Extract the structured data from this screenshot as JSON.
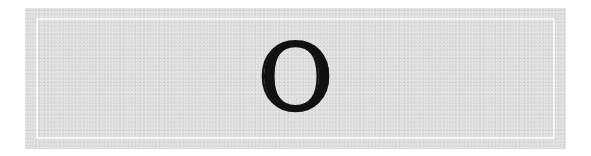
{
  "banner": {
    "letter": "O",
    "colors": {
      "panel": "#dcdcdc",
      "outer": "#ffffff",
      "inner_line": "#f4f4f4",
      "letter": "#111111"
    }
  }
}
